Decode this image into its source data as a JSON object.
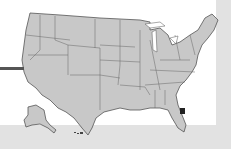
{
  "map": {
    "title": "",
    "subject": "United States map",
    "highlighted_region": "Northeast Florida",
    "colors": {
      "state_fill": "#c8c8c8",
      "state_border": "#555555",
      "highlight": "#222222",
      "panel": "#ffffff",
      "background": "#e4e4e4",
      "pointer_line": "#555555"
    }
  }
}
